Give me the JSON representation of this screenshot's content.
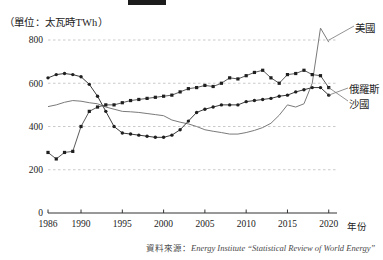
{
  "header": {
    "redaction_present": true,
    "unit_label": "（單位：太瓦時TWh）"
  },
  "axis": {
    "x_name": "年份",
    "y_ticks": [
      "800",
      "600",
      "400",
      "200",
      "0"
    ],
    "x_ticks": [
      "1986",
      "1990",
      "1995",
      "2000",
      "2005",
      "2010",
      "2015",
      "2020"
    ]
  },
  "legend": {
    "us": "美國",
    "russia": "俄羅斯",
    "saudi": "沙國"
  },
  "source": {
    "prefix": "資料來源：",
    "text": "Energy Institute “Statistical Review of World Energy”"
  },
  "colors": {
    "us": "#7a7a7a",
    "russia": "#3a3a3a",
    "saudi": "#5a5a5a",
    "grid": "#bdbdbd",
    "axis": "#333333"
  },
  "chart_data": {
    "type": "line",
    "title": "（單位：太瓦時TWh）",
    "xlabel": "年份",
    "ylabel": "太瓦時TWh",
    "xlim": [
      1986,
      2021
    ],
    "ylim": [
      0,
      880
    ],
    "yticks": [
      0,
      200,
      400,
      600,
      800
    ],
    "xticks": [
      1986,
      1990,
      1995,
      2000,
      2005,
      2010,
      2015,
      2020
    ],
    "grid": true,
    "legend_position": "right",
    "x": [
      1986,
      1987,
      1988,
      1989,
      1990,
      1991,
      1992,
      1993,
      1994,
      1995,
      1996,
      1997,
      1998,
      1999,
      2000,
      2001,
      2002,
      2003,
      2004,
      2005,
      2006,
      2007,
      2008,
      2009,
      2010,
      2011,
      2012,
      2013,
      2014,
      2015,
      2016,
      2017,
      2018,
      2019,
      2020
    ],
    "series": [
      {
        "name": "美國",
        "marker": "none",
        "values": [
          492,
          500,
          512,
          520,
          517,
          510,
          505,
          490,
          480,
          470,
          468,
          465,
          460,
          455,
          450,
          430,
          420,
          412,
          400,
          385,
          378,
          372,
          365,
          365,
          372,
          382,
          395,
          415,
          452,
          500,
          490,
          505,
          600,
          855,
          790
        ]
      },
      {
        "name": "俄羅斯",
        "marker": "circle",
        "values": [
          625,
          640,
          645,
          640,
          630,
          595,
          540,
          470,
          400,
          370,
          365,
          360,
          355,
          350,
          350,
          360,
          385,
          425,
          465,
          480,
          490,
          500,
          500,
          500,
          515,
          520,
          525,
          530,
          540,
          545,
          560,
          570,
          580,
          580,
          545
        ]
      },
      {
        "name": "沙國",
        "marker": "square",
        "values": [
          280,
          250,
          280,
          285,
          400,
          470,
          490,
          500,
          500,
          510,
          520,
          525,
          530,
          535,
          540,
          545,
          560,
          575,
          580,
          590,
          585,
          600,
          625,
          620,
          635,
          650,
          660,
          625,
          600,
          640,
          645,
          660,
          640,
          635,
          580
        ]
      }
    ]
  }
}
